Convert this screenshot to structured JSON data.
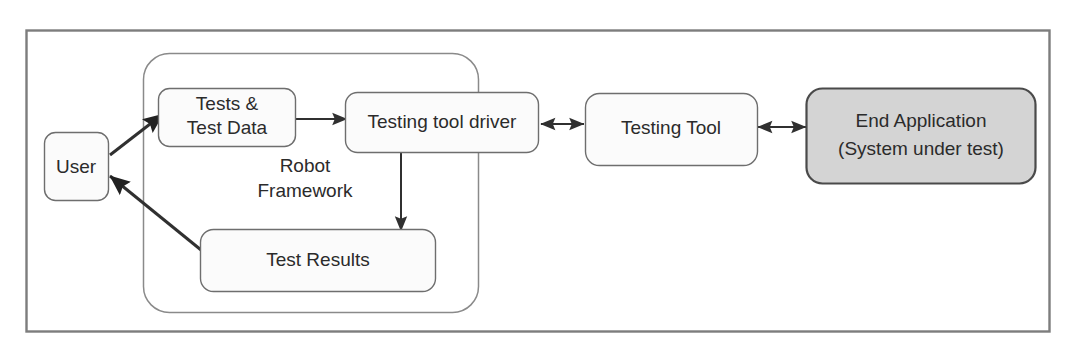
{
  "diagram": {
    "frame": {
      "name": "outer-frame"
    },
    "group": {
      "label_line1": "Robot",
      "label_line2": "Framework",
      "label": "Robot Framework"
    },
    "nodes": [
      {
        "id": "user",
        "label": "User",
        "lines": [
          "User"
        ],
        "shaded": false
      },
      {
        "id": "tests-and-test-data",
        "label": "Tests & Test Data",
        "lines": [
          "Tests &",
          "Test Data"
        ],
        "shaded": false
      },
      {
        "id": "testing-tool-driver",
        "label": "Testing tool driver",
        "lines": [
          "Testing tool driver"
        ],
        "shaded": false
      },
      {
        "id": "test-results",
        "label": "Test Results",
        "lines": [
          "Test Results"
        ],
        "shaded": false
      },
      {
        "id": "testing-tool",
        "label": "Testing Tool",
        "lines": [
          "Testing Tool"
        ],
        "shaded": false
      },
      {
        "id": "end-application",
        "label": "End Application (System under test)",
        "lines": [
          "End Application",
          "(System under test)"
        ],
        "shaded": true
      }
    ],
    "connectors": [
      {
        "id": "user-to-tests",
        "from": "user",
        "to": "tests-and-test-data",
        "direction": "one-way"
      },
      {
        "id": "test-results-to-user",
        "from": "test-results",
        "to": "user",
        "direction": "one-way"
      },
      {
        "id": "tests-to-driver",
        "from": "tests-and-test-data",
        "to": "testing-tool-driver",
        "direction": "one-way"
      },
      {
        "id": "driver-to-test-results",
        "from": "testing-tool-driver",
        "to": "test-results",
        "direction": "one-way"
      },
      {
        "id": "driver-to-testing-tool",
        "from": "testing-tool-driver",
        "to": "testing-tool",
        "direction": "two-way"
      },
      {
        "id": "testing-tool-to-end-application",
        "from": "testing-tool",
        "to": "end-application",
        "direction": "two-way"
      }
    ],
    "colors": {
      "node_fill": "#fbfbfb",
      "node_stroke": "#6e6e6e",
      "shaded_fill": "#d4d4d4",
      "shaded_stroke": "#4a4a4a",
      "group_stroke": "#8a8a8a",
      "frame_stroke": "#7d7d7d",
      "connector": "#303030",
      "text": "#2b2b2b",
      "background": "#ffffff"
    }
  }
}
